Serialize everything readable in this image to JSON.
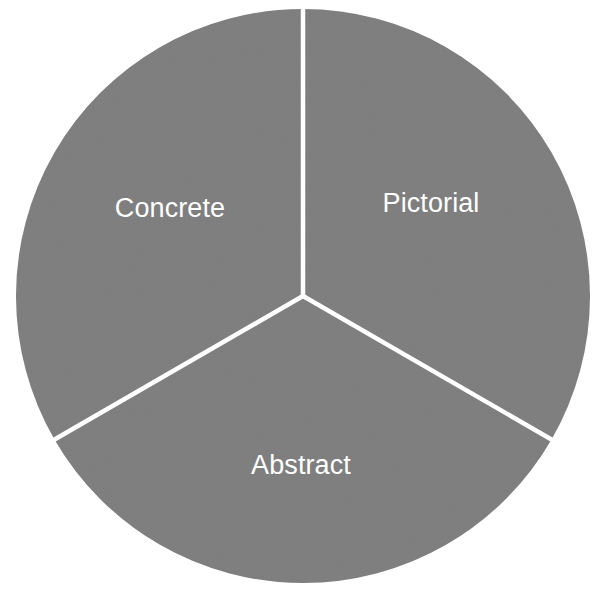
{
  "chart_data": {
    "type": "pie",
    "title": "",
    "subtitle": "",
    "xlabel": "",
    "ylabel": "",
    "legend": null,
    "grid": false,
    "slice_colors": [
      "#808080",
      "#808080",
      "#808080"
    ],
    "divider_color": "#ffffff",
    "background_color": "#ffffff",
    "label_color": "#ffffff",
    "start_angle_deg": 90,
    "direction": "clockwise",
    "categories": [
      "Pictorial",
      "Abstract",
      "Concrete"
    ],
    "values": [
      33.3333,
      33.3333,
      33.3333
    ],
    "slices": [
      {
        "label": "Pictorial",
        "value": 33.3333,
        "percent": "33.3%",
        "start_angle_deg": 90,
        "end_angle_deg": -30,
        "color": "#808080",
        "label_x": 431,
        "label_y": 204
      },
      {
        "label": "Abstract",
        "value": 33.3333,
        "percent": "33.3%",
        "start_angle_deg": -30,
        "end_angle_deg": -150,
        "color": "#808080",
        "label_x": 301,
        "label_y": 466
      },
      {
        "label": "Concrete",
        "value": 33.3333,
        "percent": "33.3%",
        "start_angle_deg": -150,
        "end_angle_deg": -270,
        "color": "#808080",
        "label_x": 170,
        "label_y": 209
      }
    ],
    "geometry": {
      "center_x": 303,
      "center_y": 296,
      "radius": 287,
      "divider_width": 4.5
    }
  }
}
